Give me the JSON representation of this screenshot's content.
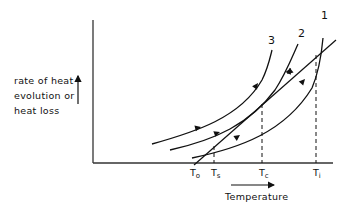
{
  "diagram": {
    "y_axis_label_lines": [
      "rate of heat",
      "evolution or",
      "heat loss"
    ],
    "x_axis_label": "Temperature",
    "temperature_marks": [
      {
        "label": "T",
        "sub": "o",
        "name": "T0"
      },
      {
        "label": "T",
        "sub": "s",
        "name": "Ts"
      },
      {
        "label": "T",
        "sub": "c",
        "name": "Tc"
      },
      {
        "label": "T",
        "sub": "i",
        "name": "Ti"
      }
    ],
    "curve_labels": {
      "curve1": "1",
      "curve2": "2",
      "curve3": "3"
    },
    "colors": {
      "ink": "#111111",
      "background": "#ffffff"
    }
  }
}
